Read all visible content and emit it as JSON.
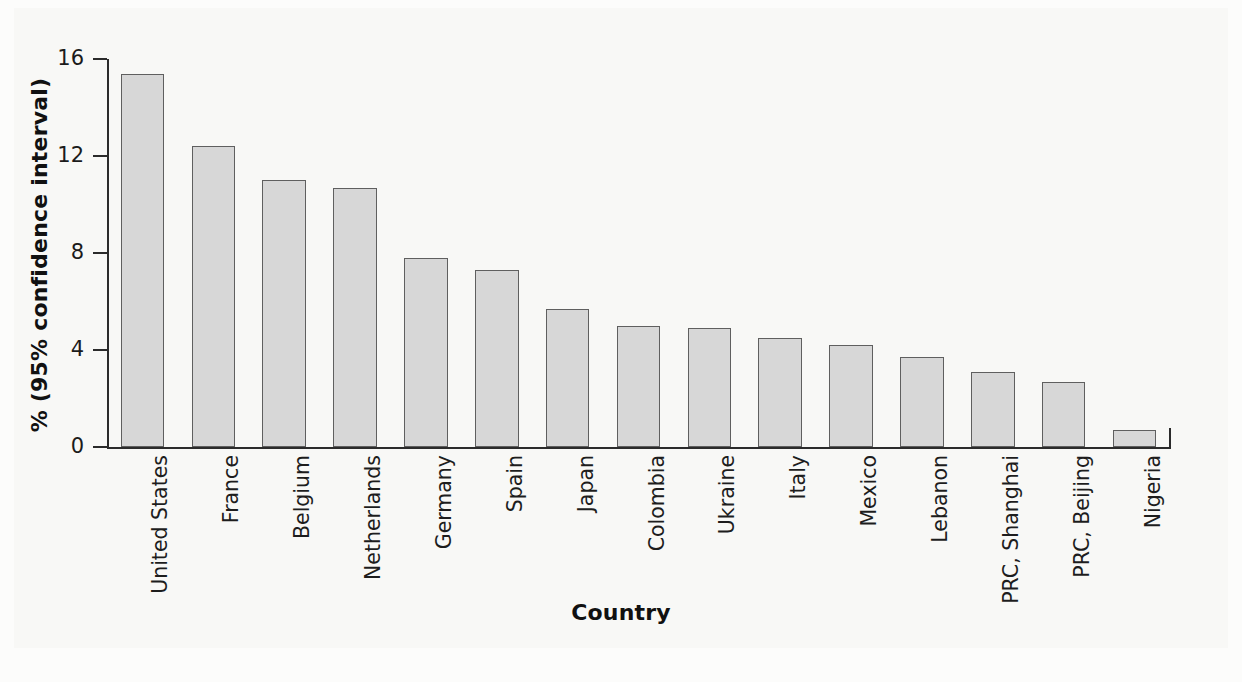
{
  "chart_data": {
    "type": "bar",
    "title": "",
    "xlabel": "Country",
    "ylabel": "% (95% confidence interval)",
    "categories": [
      "United States",
      "France",
      "Belgium",
      "Netherlands",
      "Germany",
      "Spain",
      "Japan",
      "Colombia",
      "Ukraine",
      "Italy",
      "Mexico",
      "Lebanon",
      "PRC, Shanghai",
      "PRC, Beijing",
      "Nigeria"
    ],
    "values": [
      15.4,
      12.4,
      11.0,
      10.7,
      7.8,
      7.3,
      5.7,
      5.0,
      4.9,
      4.5,
      4.2,
      3.7,
      3.1,
      2.7,
      0.7
    ],
    "ylim": [
      0,
      16
    ],
    "yticks": [
      0,
      4,
      8,
      12,
      16
    ],
    "ytick_labels": [
      "0",
      "4",
      "8",
      "12",
      "16"
    ],
    "grid": false,
    "legend": "none",
    "bar_fill_color": "#d7d7d7",
    "bar_border_color": "#5f5f5f",
    "axis_color": "#2b2b2b",
    "background_color": "#f8f8f6"
  }
}
